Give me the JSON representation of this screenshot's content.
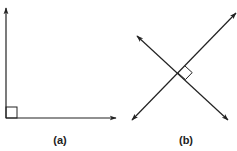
{
  "figure": {
    "panels": [
      {
        "id": "a",
        "label": "(a)",
        "description": "right angle formed by two rays",
        "vertex": [
          6,
          118
        ],
        "rays": [
          {
            "direction": "up",
            "tip": [
              6,
              8
            ]
          },
          {
            "direction": "right",
            "tip": [
              116,
              118
            ]
          }
        ],
        "right_angle_marker_size": 11
      },
      {
        "id": "b",
        "label": "(b)",
        "description": "perpendicular intersecting lines",
        "intersection": [
          178,
          73
        ],
        "lines": [
          {
            "from": [
              132,
              120
            ],
            "to": [
              236,
              13
            ]
          },
          {
            "from": [
              137,
              36
            ],
            "to": [
              228,
              120
            ]
          }
        ],
        "right_angle_marker_size": 10
      }
    ],
    "colors": {
      "stroke": "#222222",
      "background": "#ffffff"
    }
  }
}
